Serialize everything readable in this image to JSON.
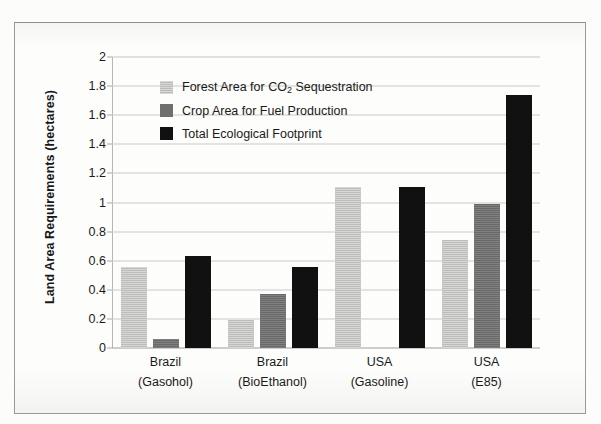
{
  "chart_data": {
    "type": "bar",
    "title": "",
    "subtitle": "",
    "xlabel": "",
    "ylabel": "Land Area Requirements (hectares)",
    "ylim": [
      0,
      2
    ],
    "ytick_step": 0.2,
    "ytick_labels": [
      "2",
      "1.8",
      "1.6",
      "1.4",
      "1.2",
      "1",
      "0.8",
      "0.6",
      "0.4",
      "0.2",
      "0"
    ],
    "ytick_values": [
      2,
      1.8,
      1.6,
      1.4,
      1.2,
      1,
      0.8,
      0.6,
      0.4,
      0.2,
      0
    ],
    "grid": true,
    "legend_position": "upper-left-inside",
    "categories": [
      "Brazil (Gasohol)",
      "Brazil (BioEthanol)",
      "USA (Gasoline)",
      "USA (E85)"
    ],
    "category_lines": [
      {
        "line1": "Brazil",
        "line2": "(Gasohol)"
      },
      {
        "line1": "Brazil",
        "line2": "(BioEthanol)"
      },
      {
        "line1": "USA",
        "line2": "(Gasoline)"
      },
      {
        "line1": "USA",
        "line2": "(E85)"
      }
    ],
    "series": [
      {
        "name": "Forest Area for CO2 Sequestration",
        "name_html": "Forest Area for CO<sub>2</sub> Sequestration",
        "color": "#c6c6c4",
        "values": [
          0.56,
          0.19,
          1.11,
          0.74
        ]
      },
      {
        "name": "Crop Area for Fuel Production",
        "name_html": "Crop Area for Fuel Production",
        "color": "#6f6f6f",
        "values": [
          0.06,
          0.37,
          0,
          0.99
        ]
      },
      {
        "name": "Total Ecological Footprint",
        "name_html": "Total Ecological Footprint",
        "color": "#111111",
        "values": [
          0.63,
          0.56,
          1.11,
          1.74
        ]
      }
    ]
  },
  "figure": {
    "background_color": "#fdfdfc",
    "border_color": "#9a9a9a",
    "grid_color": "#c9c9c7",
    "axis_color": "#b6b6b4",
    "text_color": "#1a1a1a"
  }
}
